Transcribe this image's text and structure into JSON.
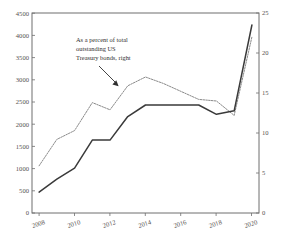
{
  "chart_data": {
    "type": "line",
    "title": "",
    "xlabel": "",
    "ylabel": "",
    "x": [
      2008,
      2009,
      2010,
      2011,
      2012,
      2013,
      2014,
      2015,
      2016,
      2017,
      2018,
      2019,
      2020
    ],
    "xlim": [
      2007.6,
      2020.4
    ],
    "x_ticks": [
      2008,
      2010,
      2012,
      2014,
      2016,
      2018,
      2020
    ],
    "x_tick_labels": [
      "2008",
      "2010",
      "2012",
      "2014",
      "2016",
      "2018",
      "2020"
    ],
    "grid": false,
    "legend_position": "annotation-inside-plot",
    "axes": [
      {
        "id": "left",
        "side": "left",
        "ylim": [
          0,
          4500
        ],
        "y_ticks": [
          0,
          500,
          1000,
          1500,
          2000,
          2500,
          3000,
          3500,
          4000,
          4500
        ],
        "y_tick_labels": [
          "0",
          "500",
          "1000",
          "1500",
          "2000",
          "2500",
          "3000",
          "3500",
          "4000",
          "4500"
        ]
      },
      {
        "id": "right",
        "side": "right",
        "ylim": [
          0,
          25
        ],
        "y_ticks": [
          0,
          5,
          10,
          15,
          20,
          25
        ],
        "y_tick_labels": [
          "0",
          "5",
          "10",
          "15",
          "20",
          "25"
        ]
      }
    ],
    "series": [
      {
        "name": "level-left-axis",
        "axis": "left",
        "style": "solid",
        "color": "#3a3a3a",
        "values": [
          470,
          760,
          1010,
          1640,
          1640,
          2170,
          2430,
          2430,
          2430,
          2430,
          2220,
          2300,
          4230
        ]
      },
      {
        "name": "As a percent of total outstanding US Treasury bonds, right",
        "axis": "right",
        "style": "dotted",
        "color": "#8a8a8a",
        "values": [
          5.9,
          9.2,
          10.3,
          13.8,
          12.9,
          15.9,
          17.0,
          16.2,
          15.2,
          14.2,
          14.0,
          12.2,
          22.0
        ]
      }
    ],
    "annotations": [
      {
        "id": "series-callout",
        "lines": [
          "As a percent of total",
          "outstanding US",
          "Treasury bonds, right"
        ],
        "points_to_year": 2013
      }
    ]
  }
}
